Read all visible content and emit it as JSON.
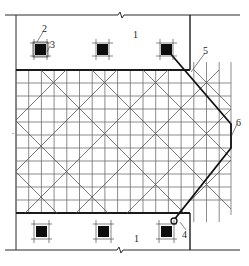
{
  "diagram": {
    "title": "",
    "colors": {
      "background": "#ffffff",
      "line": "#2a2a2a",
      "grid": "#6e6e6e",
      "diagonal": "#555555",
      "column": "#0d0d0d"
    },
    "labels": {
      "region_top": "1",
      "region_bottom": "1",
      "callout_2": "2",
      "callout_3": "3",
      "callout_4": "4",
      "callout_5": "5",
      "callout_6": "6"
    },
    "callouts": [
      {
        "id": "1",
        "meaning": "slab region (top and bottom)"
      },
      {
        "id": "2",
        "meaning": "column frame"
      },
      {
        "id": "3",
        "meaning": "column"
      },
      {
        "id": "4",
        "meaning": "connection node"
      },
      {
        "id": "5",
        "meaning": "bold diagonal boundary"
      },
      {
        "id": "6",
        "meaning": "right edge boundary"
      }
    ],
    "grid": {
      "x_lines": [
        16,
        28.7,
        41.4,
        54.1,
        66.8,
        79.5,
        92.2,
        104.9,
        117.6,
        130.3,
        143,
        155.7,
        168.4,
        181.1,
        193.8,
        206.5,
        219.2,
        231
      ],
      "y_lines": [
        70,
        83,
        96,
        109,
        122,
        135,
        148,
        161,
        174,
        187,
        200,
        213
      ],
      "columns_top_y": 50,
      "columns_bottom_y": 232,
      "column_x": [
        40,
        102,
        166
      ]
    }
  }
}
